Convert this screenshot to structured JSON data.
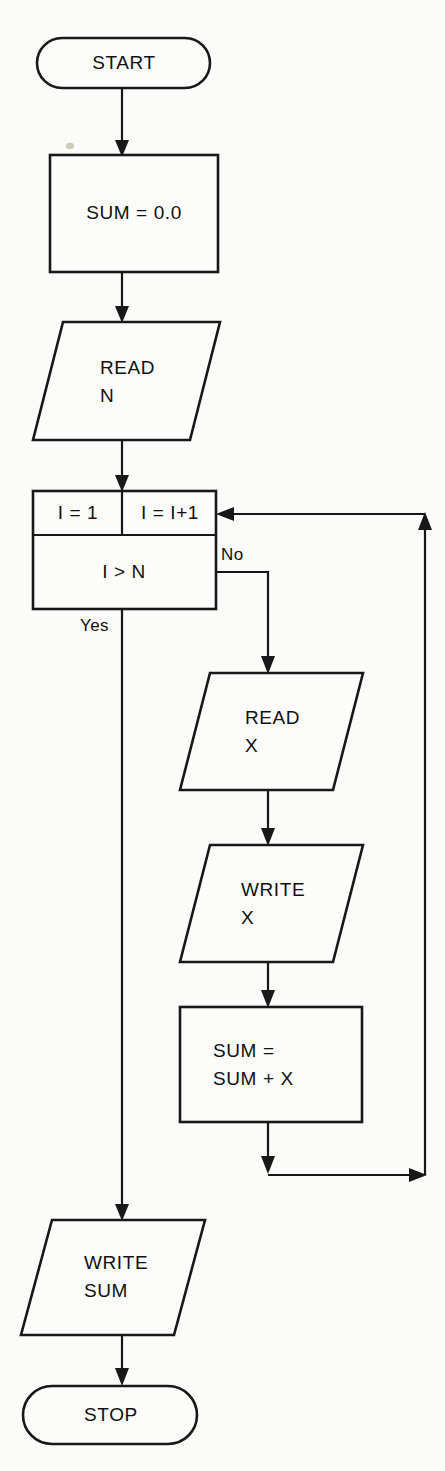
{
  "diagram": {
    "type": "flowchart",
    "colors": {
      "background": "#fbfbf9",
      "stroke": "#18181a",
      "shape_fill": "#fcfcfa"
    },
    "nodes": [
      {
        "id": "start",
        "shape": "terminal",
        "lines": [
          "START"
        ],
        "text": "START"
      },
      {
        "id": "init-sum",
        "shape": "process",
        "lines": [
          "SUM  =  0.0"
        ],
        "text": "SUM  =  0.0"
      },
      {
        "id": "read-n",
        "shape": "io-parallelogram",
        "lines": [
          "READ",
          "N"
        ],
        "line1": "READ",
        "line2": "N"
      },
      {
        "id": "loop-control",
        "shape": "loop-box",
        "init": "I  =  1",
        "increment": "I  =  I+1",
        "condition": "I  >  N"
      },
      {
        "id": "read-x",
        "shape": "io-parallelogram",
        "lines": [
          "READ",
          "X"
        ],
        "line1": "READ",
        "line2": "X"
      },
      {
        "id": "write-x",
        "shape": "io-parallelogram",
        "lines": [
          "WRITE",
          "X"
        ],
        "line1": "WRITE",
        "line2": "X"
      },
      {
        "id": "accumulate",
        "shape": "process",
        "lines": [
          "SUM  =",
          "SUM  +  X"
        ],
        "line1": "SUM  =",
        "line2": "SUM  +  X"
      },
      {
        "id": "write-sum",
        "shape": "io-parallelogram",
        "lines": [
          "WRITE",
          "SUM"
        ],
        "line1": "WRITE",
        "line2": "SUM"
      },
      {
        "id": "stop",
        "shape": "terminal",
        "lines": [
          "STOP"
        ],
        "text": "STOP"
      }
    ],
    "branch_labels": {
      "yes": "Yes",
      "no": "No"
    },
    "edges": [
      {
        "from": "start",
        "to": "init-sum",
        "label": ""
      },
      {
        "from": "init-sum",
        "to": "read-n",
        "label": ""
      },
      {
        "from": "read-n",
        "to": "loop-control",
        "label": ""
      },
      {
        "from": "loop-control",
        "to": "read-x",
        "label": "No"
      },
      {
        "from": "loop-control",
        "to": "write-sum",
        "label": "Yes"
      },
      {
        "from": "read-x",
        "to": "write-x",
        "label": ""
      },
      {
        "from": "write-x",
        "to": "accumulate",
        "label": ""
      },
      {
        "from": "accumulate",
        "to": "loop-control",
        "label": ""
      },
      {
        "from": "write-sum",
        "to": "stop",
        "label": ""
      }
    ]
  }
}
